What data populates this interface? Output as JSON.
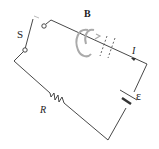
{
  "diagram": {
    "type": "circuit",
    "labels": {
      "switch": "S",
      "magnetic_field": "B",
      "current": "I",
      "resistor": "R",
      "emf": "ε"
    },
    "colors": {
      "wire": "#333333",
      "field_arcs": "#a8a8a8",
      "background": "#ffffff"
    },
    "components": [
      {
        "id": "switch",
        "label": "S",
        "state": "open"
      },
      {
        "id": "resistor",
        "label": "R"
      },
      {
        "id": "battery",
        "label": "ε"
      },
      {
        "id": "field",
        "label": "B"
      },
      {
        "id": "current",
        "label": "I"
      }
    ]
  }
}
